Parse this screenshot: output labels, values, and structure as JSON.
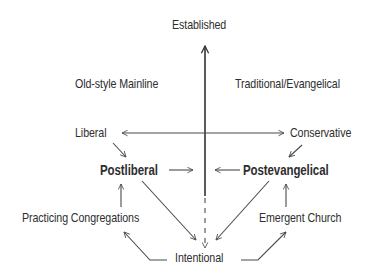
{
  "diagram": {
    "type": "quadrant-flow-diagram",
    "axes": {
      "vertical_top": "Established",
      "horizontal_left": "Liberal",
      "horizontal_right": "Conservative",
      "vertical_bottom": "Intentional"
    },
    "quadrants": {
      "upper_left": "Old-style Mainline",
      "upper_right": "Traditional/Evangelical"
    },
    "nodes": {
      "established": "Established",
      "old_style_mainline": "Old-style Mainline",
      "traditional_evangelical": "Traditional/Evangelical",
      "liberal": "Liberal",
      "conservative": "Conservative",
      "postliberal": "Postliberal",
      "postevangelical": "Postevangelical",
      "practicing_congregations": "Practicing Congregations",
      "emergent_church": "Emergent Church",
      "intentional": "Intentional"
    },
    "edges": [
      {
        "from": "Liberal",
        "to": "Postliberal"
      },
      {
        "from": "Conservative",
        "to": "Postevangelical"
      },
      {
        "from": "Postliberal",
        "to": "center-axis"
      },
      {
        "from": "Postevangelical",
        "to": "center-axis"
      },
      {
        "from": "Postliberal",
        "to": "Intentional"
      },
      {
        "from": "Postevangelical",
        "to": "Intentional"
      },
      {
        "from": "Practicing Congregations",
        "to": "Postliberal"
      },
      {
        "from": "Emergent Church",
        "to": "Postevangelical"
      },
      {
        "from": "Intentional",
        "to": "Practicing Congregations"
      },
      {
        "from": "Intentional",
        "to": "Emergent Church"
      },
      {
        "from": "center-axis",
        "to": "Intentional",
        "style": "dashed"
      }
    ],
    "colors": {
      "text": "#2e2e2e",
      "lines": "#4a4a4a",
      "background": "#ffffff"
    }
  }
}
